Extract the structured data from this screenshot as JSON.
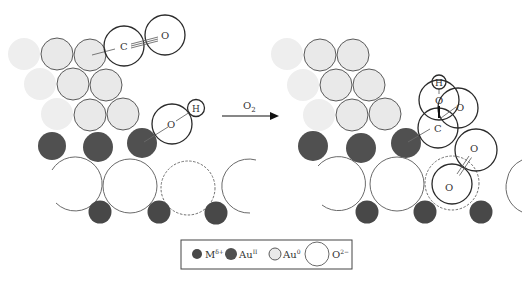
{
  "diagram": {
    "type": "reaction-mechanism-schematic",
    "arrow": {
      "label": "O",
      "label_sub": "2"
    },
    "left_panel": {
      "adsorbates": {
        "co": {
          "c_label": "C",
          "o_label": "O",
          "bond": "triple"
        },
        "oh": {
          "o_label": "O",
          "h_label": "H"
        }
      }
    },
    "right_panel": {
      "adsorbates": {
        "cooh": {
          "h_label": "H",
          "o1_label": "O",
          "o2_label": "O",
          "c_label": "C"
        },
        "o2": {
          "o_top_label": "O",
          "o_bottom_label": "O",
          "bond": "double"
        }
      }
    }
  },
  "legend": {
    "items": [
      {
        "symbol": "M",
        "sup": "δ+",
        "swatch": "dark-small",
        "color": "#484848"
      },
      {
        "symbol": "Au",
        "sup": "II",
        "swatch": "dark-medium",
        "color": "#505050"
      },
      {
        "symbol": "Au",
        "sup": "0",
        "swatch": "light-medium",
        "color": "#e9e9e9"
      },
      {
        "symbol": "O",
        "sup": "2−",
        "swatch": "white-large",
        "color": "#ffffff"
      }
    ]
  },
  "colors": {
    "au0": "#e9e9e9",
    "au2": "#505050",
    "m": "#484848",
    "oxide": "#ffffff",
    "outline": "#2a2a2a"
  }
}
